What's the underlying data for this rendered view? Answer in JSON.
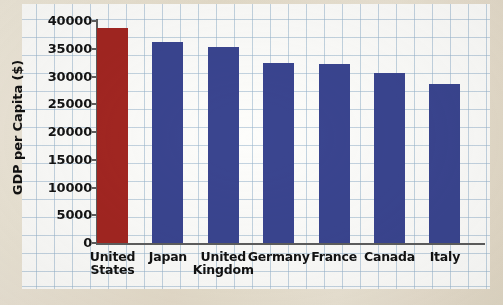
{
  "chart_data": {
    "type": "bar",
    "title": "",
    "xlabel": "",
    "ylabel": "GDP per Capita ($)",
    "categories": [
      "United States",
      "Japan",
      "United Kingdom",
      "Germany",
      "France",
      "Canada",
      "Italy"
    ],
    "values": [
      38800,
      36200,
      35400,
      32400,
      32200,
      30700,
      28700
    ],
    "bar_colors": [
      "#a32621",
      "#3a4590",
      "#3a4590",
      "#3a4590",
      "#3a4590",
      "#3a4590",
      "#3a4590"
    ],
    "highlight_category": "United States",
    "highlight_color": "#a32621",
    "series_color": "#3a4590",
    "ylim": [
      0,
      40000
    ],
    "yticks": [
      0,
      5000,
      10000,
      15000,
      20000,
      25000,
      30000,
      35000,
      40000
    ],
    "ytick_labels": [
      "0",
      "5000",
      "10000",
      "15000",
      "20000",
      "25000",
      "30000",
      "35000",
      "40000"
    ],
    "grid": true,
    "grid_style": "graph-paper",
    "legend": "none"
  },
  "canvas": {
    "paper_color": "#e9e1d2",
    "plot_background": "#fdfdfb",
    "grid_color": "#96b4cd",
    "axis_color": "#5d5d5d"
  }
}
